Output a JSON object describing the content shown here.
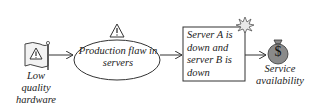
{
  "diagram": {
    "nodes": [
      {
        "id": "cause",
        "type": "flag-hazard",
        "label_lines": [
          "Low",
          "quality",
          "hardware"
        ]
      },
      {
        "id": "flaw",
        "type": "ellipse",
        "label_lines": [
          "Production flaw in",
          "servers"
        ]
      },
      {
        "id": "event",
        "type": "box",
        "label_lines": [
          "Server A is",
          "down and",
          "server B is",
          "down"
        ]
      },
      {
        "id": "loss",
        "type": "money-bag",
        "label_lines": [
          "Service",
          "availability"
        ],
        "symbol": "$"
      }
    ],
    "edges": [
      {
        "from": "cause",
        "to": "flaw"
      },
      {
        "from": "flaw",
        "to": "event"
      },
      {
        "from": "event",
        "to": "loss"
      }
    ],
    "icons": {
      "warning": "warning-triangle-icon",
      "explosion": "explosion-burst-icon",
      "money": "money-bag-icon"
    },
    "colors": {
      "stroke": "#333333",
      "money_bag": "#8a8a8a",
      "flag_fill": "#f2f2f2"
    }
  }
}
